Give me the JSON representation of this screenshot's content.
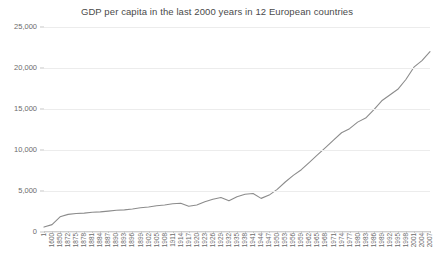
{
  "chart_data": {
    "type": "line",
    "title": "GDP per capita in the last 2000 years in 12 European countries",
    "xlabel": "",
    "ylabel": "",
    "ylim": [
      0,
      25000
    ],
    "ytick_labels": [
      "0",
      "5,000",
      "10,000",
      "15,000",
      "20,000",
      "25,000"
    ],
    "ytick_values": [
      0,
      5000,
      10000,
      15000,
      20000,
      25000
    ],
    "grid": "horizontal",
    "legend": "none",
    "line_color": "#8c8c8c",
    "categories": [
      "1",
      "1600",
      "1850",
      "1872",
      "1875",
      "1878",
      "1881",
      "1884",
      "1887",
      "1890",
      "1893",
      "1896",
      "1899",
      "1902",
      "1905",
      "1908",
      "1911",
      "1914",
      "1917",
      "1920",
      "1923",
      "1926",
      "1929",
      "1932",
      "1935",
      "1938",
      "1941",
      "1944",
      "1947",
      "1950",
      "1953",
      "1956",
      "1959",
      "1962",
      "1965",
      "1968",
      "1971",
      "1974",
      "1977",
      "1980",
      "1983",
      "1986",
      "1989",
      "1992",
      "1995",
      "1998",
      "2001",
      "2004",
      "2007"
    ],
    "series": [
      {
        "name": "GDP per capita",
        "values": [
          600,
          900,
          1850,
          2150,
          2250,
          2300,
          2400,
          2450,
          2550,
          2650,
          2700,
          2800,
          2950,
          3050,
          3200,
          3300,
          3450,
          3500,
          3150,
          3300,
          3700,
          4000,
          4200,
          3800,
          4300,
          4600,
          4700,
          4100,
          4500,
          5200,
          6100,
          6900,
          7600,
          8500,
          9400,
          10300,
          11200,
          12100,
          12600,
          13400,
          13900,
          14900,
          16000,
          16700,
          17400,
          18600,
          20100,
          20900,
          22000
        ]
      }
    ],
    "xtick_count": 49
  }
}
